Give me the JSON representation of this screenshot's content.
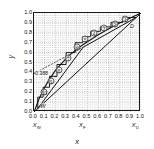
{
  "chart_data": {
    "type": "line",
    "title": "",
    "xlabel": "x",
    "ylabel": "y",
    "xlim": [
      0.0,
      1.0
    ],
    "ylim": [
      0.0,
      1.0
    ],
    "grid": "dotted",
    "legend": "none",
    "x_ticks": [
      "0.0",
      "0.1",
      "0.2",
      "0.3",
      "0.4",
      "0.5",
      "0.6",
      "0.7",
      "0.8",
      "0.9",
      "1.0"
    ],
    "y_ticks": [
      "0.0",
      "0.1",
      "0.2",
      "0.3",
      "0.4",
      "0.5",
      "0.6",
      "0.7",
      "0.8",
      "0.9",
      "1.0"
    ],
    "annotations": {
      "feed_intercept_value": "0.388",
      "bottom_point_label": "W",
      "top_point_label": "D",
      "composition_markers": [
        {
          "label": "X",
          "sub": "W",
          "x": 0.035
        },
        {
          "label": "X",
          "sub": "F",
          "x": 0.46
        },
        {
          "label": "X",
          "sub": "D",
          "x": 0.955
        }
      ]
    },
    "series": [
      {
        "name": "diagonal-45-degree-line",
        "type": "line",
        "x": [
          0.0,
          1.0
        ],
        "y": [
          0.0,
          1.0
        ]
      },
      {
        "name": "equilibrium-curve",
        "type": "line",
        "x": [
          0.0,
          0.05,
          0.1,
          0.15,
          0.2,
          0.25,
          0.3,
          0.35,
          0.4,
          0.45,
          0.5,
          0.55,
          0.6,
          0.65,
          0.7,
          0.75,
          0.8,
          0.85,
          0.9,
          0.95,
          1.0
        ],
        "y": [
          0.0,
          0.14,
          0.25,
          0.34,
          0.42,
          0.48,
          0.54,
          0.59,
          0.635,
          0.675,
          0.71,
          0.745,
          0.78,
          0.81,
          0.84,
          0.87,
          0.9,
          0.925,
          0.95,
          0.975,
          1.0
        ]
      },
      {
        "name": "rectifying-operating-line",
        "type": "line",
        "x": [
          0.46,
          0.955
        ],
        "y": [
          0.655,
          0.955
        ]
      },
      {
        "name": "stripping-operating-line",
        "type": "line",
        "x": [
          0.035,
          0.46
        ],
        "y": [
          0.035,
          0.655
        ]
      },
      {
        "name": "q-line",
        "type": "line",
        "x": [
          0.0,
          0.46
        ],
        "y": [
          0.388,
          0.655
        ]
      },
      {
        "name": "stage-staircase",
        "type": "step",
        "points": [
          [
            0.955,
            0.955
          ],
          [
            0.83,
            0.955
          ],
          [
            0.83,
            0.905
          ],
          [
            0.72,
            0.905
          ],
          [
            0.72,
            0.86
          ],
          [
            0.62,
            0.86
          ],
          [
            0.62,
            0.815
          ],
          [
            0.53,
            0.815
          ],
          [
            0.53,
            0.76
          ],
          [
            0.455,
            0.76
          ],
          [
            0.455,
            0.7
          ],
          [
            0.385,
            0.7
          ],
          [
            0.385,
            0.6
          ],
          [
            0.3,
            0.6
          ],
          [
            0.3,
            0.48
          ],
          [
            0.215,
            0.48
          ],
          [
            0.215,
            0.36
          ],
          [
            0.145,
            0.36
          ],
          [
            0.145,
            0.25
          ],
          [
            0.085,
            0.25
          ],
          [
            0.085,
            0.15
          ],
          [
            0.035,
            0.15
          ],
          [
            0.035,
            0.035
          ]
        ]
      }
    ],
    "stage_numbers": [
      {
        "label": "1",
        "x": 0.855,
        "y": 0.935
      },
      {
        "label": "2",
        "x": 0.755,
        "y": 0.89
      },
      {
        "label": "3",
        "x": 0.655,
        "y": 0.845
      },
      {
        "label": "4",
        "x": 0.56,
        "y": 0.795
      },
      {
        "label": "5",
        "x": 0.48,
        "y": 0.74
      },
      {
        "label": "6",
        "x": 0.405,
        "y": 0.66
      },
      {
        "label": "7",
        "x": 0.32,
        "y": 0.545
      },
      {
        "label": "8",
        "x": 0.235,
        "y": 0.425
      },
      {
        "label": "9",
        "x": 0.16,
        "y": 0.31
      },
      {
        "label": "10",
        "x": 0.098,
        "y": 0.2
      }
    ]
  }
}
